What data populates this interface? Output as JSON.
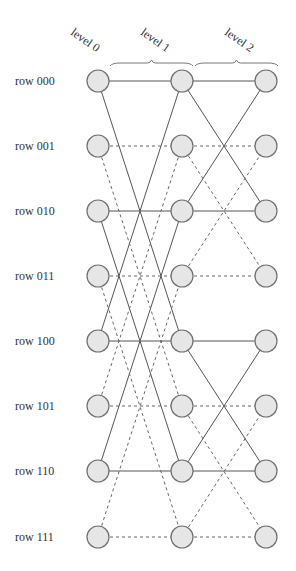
{
  "diagram": {
    "type": "butterfly-network",
    "levels": [
      {
        "label": "level 0",
        "x": 98
      },
      {
        "label": "level 1",
        "x": 182
      },
      {
        "label": "level 2",
        "x": 266
      }
    ],
    "rows": [
      {
        "label": "row 000",
        "y": 81
      },
      {
        "label": "row 001",
        "y": 146
      },
      {
        "label": "row 010",
        "y": 211
      },
      {
        "label": "row 011",
        "y": 276
      },
      {
        "label": "row 100",
        "y": 341
      },
      {
        "label": "row 101",
        "y": 406
      },
      {
        "label": "row 110",
        "y": 471
      },
      {
        "label": "row 111",
        "y": 537
      }
    ],
    "braces": [
      {
        "from_level": 0,
        "to_level": 1,
        "x1": 110,
        "x2": 193,
        "y": 66
      },
      {
        "from_level": 1,
        "to_level": 2,
        "x1": 195,
        "x2": 278,
        "y": 66
      }
    ],
    "edges": [
      {
        "from": [
          0,
          0
        ],
        "to": [
          1,
          0
        ],
        "style": "solid"
      },
      {
        "from": [
          0,
          0
        ],
        "to": [
          1,
          4
        ],
        "style": "solid"
      },
      {
        "from": [
          0,
          4
        ],
        "to": [
          1,
          4
        ],
        "style": "solid"
      },
      {
        "from": [
          0,
          4
        ],
        "to": [
          1,
          0
        ],
        "style": "solid"
      },
      {
        "from": [
          0,
          2
        ],
        "to": [
          1,
          2
        ],
        "style": "solid"
      },
      {
        "from": [
          0,
          2
        ],
        "to": [
          1,
          6
        ],
        "style": "solid"
      },
      {
        "from": [
          0,
          6
        ],
        "to": [
          1,
          6
        ],
        "style": "solid"
      },
      {
        "from": [
          0,
          6
        ],
        "to": [
          1,
          2
        ],
        "style": "solid"
      },
      {
        "from": [
          0,
          1
        ],
        "to": [
          1,
          1
        ],
        "style": "dashed"
      },
      {
        "from": [
          0,
          1
        ],
        "to": [
          1,
          5
        ],
        "style": "dashed"
      },
      {
        "from": [
          0,
          5
        ],
        "to": [
          1,
          5
        ],
        "style": "dashed"
      },
      {
        "from": [
          0,
          5
        ],
        "to": [
          1,
          1
        ],
        "style": "dashed"
      },
      {
        "from": [
          0,
          3
        ],
        "to": [
          1,
          3
        ],
        "style": "dashed"
      },
      {
        "from": [
          0,
          3
        ],
        "to": [
          1,
          7
        ],
        "style": "dashed"
      },
      {
        "from": [
          0,
          7
        ],
        "to": [
          1,
          7
        ],
        "style": "dashed"
      },
      {
        "from": [
          0,
          7
        ],
        "to": [
          1,
          3
        ],
        "style": "dashed"
      },
      {
        "from": [
          1,
          0
        ],
        "to": [
          2,
          0
        ],
        "style": "solid"
      },
      {
        "from": [
          1,
          0
        ],
        "to": [
          2,
          2
        ],
        "style": "solid"
      },
      {
        "from": [
          1,
          2
        ],
        "to": [
          2,
          2
        ],
        "style": "solid"
      },
      {
        "from": [
          1,
          2
        ],
        "to": [
          2,
          0
        ],
        "style": "solid"
      },
      {
        "from": [
          1,
          4
        ],
        "to": [
          2,
          4
        ],
        "style": "solid"
      },
      {
        "from": [
          1,
          4
        ],
        "to": [
          2,
          6
        ],
        "style": "solid"
      },
      {
        "from": [
          1,
          6
        ],
        "to": [
          2,
          6
        ],
        "style": "solid"
      },
      {
        "from": [
          1,
          6
        ],
        "to": [
          2,
          4
        ],
        "style": "solid"
      },
      {
        "from": [
          1,
          1
        ],
        "to": [
          2,
          1
        ],
        "style": "dashed"
      },
      {
        "from": [
          1,
          1
        ],
        "to": [
          2,
          3
        ],
        "style": "dashed"
      },
      {
        "from": [
          1,
          3
        ],
        "to": [
          2,
          3
        ],
        "style": "dashed"
      },
      {
        "from": [
          1,
          3
        ],
        "to": [
          2,
          1
        ],
        "style": "dashed"
      },
      {
        "from": [
          1,
          5
        ],
        "to": [
          2,
          5
        ],
        "style": "dashed"
      },
      {
        "from": [
          1,
          5
        ],
        "to": [
          2,
          7
        ],
        "style": "dashed"
      },
      {
        "from": [
          1,
          7
        ],
        "to": [
          2,
          7
        ],
        "style": "dashed"
      },
      {
        "from": [
          1,
          7
        ],
        "to": [
          2,
          5
        ],
        "style": "dashed"
      }
    ],
    "node_radius": 11,
    "colors": {
      "node_fill": "#e6e6e6",
      "node_stroke": "#707070",
      "edge": "#555555",
      "text": "#333333"
    }
  }
}
